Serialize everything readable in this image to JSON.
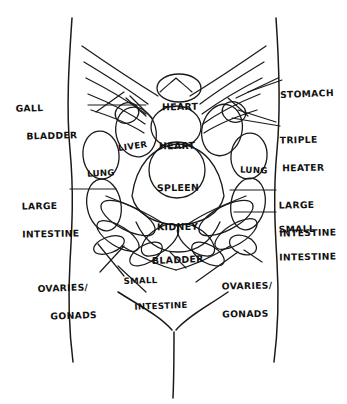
{
  "diagram": {
    "style": "hand-drawn ink sketch on white paper",
    "ink_color": "#1a1a1a",
    "background_color": "#ffffff",
    "body_part": "human torso, front view, ribcage to hips"
  },
  "outer_labels": [
    {
      "id": "gall-bladder",
      "text": "GALL\nBLADDER",
      "side": "left"
    },
    {
      "id": "large-intestine-left",
      "text": "LARGE\nINTESTINE",
      "side": "left"
    },
    {
      "id": "ovaries-gonads-left",
      "text": "OVARIES/\nGONADS",
      "side": "left"
    },
    {
      "id": "stomach",
      "text": "STOMACH",
      "side": "right"
    },
    {
      "id": "triple-heater",
      "text": "TRIPLE\nHEATER",
      "side": "right"
    },
    {
      "id": "large-intestine-right",
      "text": "LARGE\nINTESTINE",
      "side": "right"
    },
    {
      "id": "small-intestine-right",
      "text": "SMALL\nINTESTINE",
      "side": "right"
    },
    {
      "id": "ovaries-gonads-right",
      "text": "OVARIES/\nGONADS",
      "side": "right"
    }
  ],
  "organ_labels": [
    {
      "id": "heart-upper",
      "text": "HEART"
    },
    {
      "id": "heart-lower",
      "text": "HEART"
    },
    {
      "id": "liver",
      "text": "LIVER"
    },
    {
      "id": "lung-left",
      "text": "LUNG"
    },
    {
      "id": "lung-right",
      "text": "LUNG"
    },
    {
      "id": "spleen",
      "text": "SPLEEN"
    },
    {
      "id": "kidney",
      "text": "KIDNEY"
    },
    {
      "id": "bladder",
      "text": "BLADDER"
    },
    {
      "id": "small-intestine-center",
      "text": "SMALL\nINTESTINE"
    }
  ],
  "label_text": {
    "gall_bladder_l1": "GALL",
    "gall_bladder_l2": "BLADDER",
    "large_intestine_left_l1": "LARGE",
    "large_intestine_left_l2": "INTESTINE",
    "ovaries_gonads_left_l1": "OVARIES/",
    "ovaries_gonads_left_l2": "GONADS",
    "stomach": "STOMACH",
    "triple_heater_l1": "TRIPLE",
    "triple_heater_l2": "HEATER",
    "large_intestine_right_l1": "LARGE",
    "large_intestine_right_l2": "INTESTINE",
    "small_intestine_right_l1": "SMALL",
    "small_intestine_right_l2": "INTESTINE",
    "ovaries_gonads_right_l1": "OVARIES/",
    "ovaries_gonads_right_l2": "GONADS",
    "heart_upper": "HEART",
    "heart_lower": "HEART",
    "liver": "LIVER",
    "lung_left": "LUNG",
    "lung_right": "LUNG",
    "spleen": "SPLEEN",
    "kidney": "KIDNEY",
    "bladder": "BLADDER",
    "small_intestine_center_l1": "SMALL",
    "small_intestine_center_l2": "INTESTINE"
  }
}
